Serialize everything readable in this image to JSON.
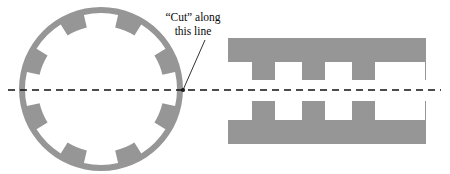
{
  "figure": {
    "background_color": "#ffffff",
    "width": 450,
    "height": 174
  },
  "annotation": {
    "line1": "“Cut” along",
    "line2": "this line",
    "text_color": "#0a0a0a",
    "leader_line_color": "#1a1a1a",
    "anchor_x": 183,
    "anchor_y": 90
  },
  "cut_line": {
    "name": "cut-centerline",
    "color": "#111111",
    "style": "dashed",
    "dash_pattern": "7 5",
    "stroke_width": 1.6,
    "y": 90,
    "x_start": 8,
    "x_end": 441
  },
  "ring": {
    "name": "slotted-ring",
    "fill_color": "#969696",
    "center_x": 101,
    "center_y": 89,
    "outer_radius": 82,
    "inner_radius": 63,
    "slot_count": 8,
    "slot_angular_width_deg": 26,
    "slot_depth": 13,
    "slot_angles_deg": [
      0,
      45,
      90,
      135,
      180,
      225,
      270,
      315
    ]
  },
  "unrolled": {
    "name": "unrolled-strip",
    "fill_color": "#969696",
    "left": 228,
    "right": 426,
    "top_band": {
      "name": "upper-comb",
      "bar_top": 38,
      "bar_bottom": 62,
      "tooth_bottom": 80,
      "tooth_count": 4,
      "tooth_width": 23,
      "tooth_pitch": 50,
      "first_tooth_left": 252
    },
    "bottom_band": {
      "name": "lower-comb",
      "bar_top": 120,
      "bar_bottom": 144,
      "tooth_top": 101,
      "tooth_count": 4,
      "tooth_width": 23,
      "tooth_pitch": 50,
      "first_tooth_left": 252
    }
  }
}
